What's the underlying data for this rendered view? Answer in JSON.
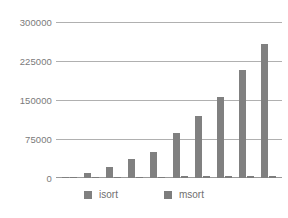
{
  "chart_data": {
    "type": "bar",
    "title": "",
    "subtitle": "",
    "xlabel": "",
    "ylabel": "",
    "ylim": [
      0,
      300000
    ],
    "ytick_labels": [
      "300000",
      "225000",
      "150000",
      "75000",
      "0"
    ],
    "ytick_values": [
      300000,
      225000,
      150000,
      75000,
      0
    ],
    "grid": true,
    "legend_position": "bottom",
    "categories": [
      "1",
      "2",
      "3",
      "4",
      "5",
      "6",
      "7",
      "8",
      "9",
      "10"
    ],
    "series": [
      {
        "name": "isort",
        "color": "#808080",
        "values": [
          2000,
          10000,
          21000,
          36500,
          50000,
          86000,
          119000,
          156000,
          208500,
          258000
        ]
      },
      {
        "name": "msort",
        "color": "#7d7d7d",
        "values": [
          900,
          1300,
          1700,
          2100,
          2600,
          3000,
          3400,
          3900,
          4300,
          4800
        ]
      }
    ]
  },
  "legend": {
    "items": [
      {
        "label": "isort",
        "color": "#808080"
      },
      {
        "label": "msort",
        "color": "#7d7d7d"
      }
    ]
  },
  "colors": {
    "bar": "#808080",
    "gridline": "#b0b0b0",
    "tick_text": "#7a7a7a",
    "legend_text": "#6f6f6f",
    "background": "#ffffff"
  }
}
